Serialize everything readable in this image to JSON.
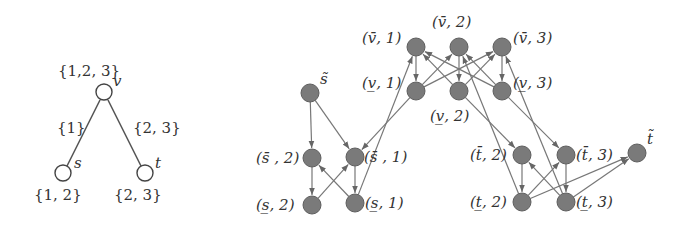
{
  "tree": {
    "nodes": [
      {
        "id": "v",
        "name": "v",
        "x": 104,
        "y": 92,
        "set": "{1,2, 3}"
      },
      {
        "id": "s",
        "name": "s",
        "x": 63,
        "y": 173,
        "set": "{1, 2}"
      },
      {
        "id": "t",
        "name": "t",
        "x": 145,
        "y": 173,
        "set": "{2, 3}"
      }
    ],
    "edges": [
      {
        "from": "v",
        "to": "s",
        "label": "{1}"
      },
      {
        "from": "v",
        "to": "t",
        "label": "{2, 3}"
      }
    ]
  },
  "graph": {
    "node_color": "#7a7a7a",
    "edge_color": "#777777",
    "nodes": [
      {
        "id": "s_tilde",
        "label": "s̃",
        "x": 310,
        "y": 93
      },
      {
        "id": "s_bar_2",
        "label": "(s̄, 2)",
        "x": 312,
        "y": 158
      },
      {
        "id": "s_bar_1",
        "label": "(s̄, 1)",
        "x": 355,
        "y": 157
      },
      {
        "id": "s_under_2",
        "label": "(s̲, 2)",
        "x": 312,
        "y": 205
      },
      {
        "id": "s_under_1",
        "label": "(s̲, 1)",
        "x": 355,
        "y": 203
      },
      {
        "id": "v_bar_1",
        "label": "(v̄, 1)",
        "x": 416,
        "y": 47
      },
      {
        "id": "v_bar_2",
        "label": "(v̄, 2)",
        "x": 459,
        "y": 47
      },
      {
        "id": "v_bar_3",
        "label": "(v̄, 3)",
        "x": 502,
        "y": 47
      },
      {
        "id": "v_under_1",
        "label": "(v̲, 1)",
        "x": 416,
        "y": 91
      },
      {
        "id": "v_under_2",
        "label": "(v̲, 2)",
        "x": 459,
        "y": 91
      },
      {
        "id": "v_under_3",
        "label": "(v̲, 3)",
        "x": 502,
        "y": 91
      },
      {
        "id": "t_bar_2",
        "label": "(t̄, 2)",
        "x": 522,
        "y": 155
      },
      {
        "id": "t_bar_3",
        "label": "(t̄, 3)",
        "x": 566,
        "y": 155
      },
      {
        "id": "t_under_2",
        "label": "(t̲, 2)",
        "x": 522,
        "y": 202
      },
      {
        "id": "t_under_3",
        "label": "(t̲, 3)",
        "x": 566,
        "y": 202
      },
      {
        "id": "t_tilde",
        "label": "t̃",
        "x": 637,
        "y": 153
      }
    ],
    "edges": [
      [
        "s_tilde",
        "s_bar_2"
      ],
      [
        "s_tilde",
        "s_bar_1"
      ],
      [
        "s_bar_2",
        "s_under_2"
      ],
      [
        "s_bar_1",
        "s_under_1"
      ],
      [
        "s_under_2",
        "s_bar_1"
      ],
      [
        "s_under_1",
        "s_bar_2"
      ],
      [
        "s_under_1",
        "v_bar_1"
      ],
      [
        "v_under_1",
        "s_bar_1"
      ],
      [
        "v_bar_1",
        "v_under_1"
      ],
      [
        "v_bar_2",
        "v_under_2"
      ],
      [
        "v_bar_3",
        "v_under_3"
      ],
      [
        "v_under_1",
        "v_bar_2"
      ],
      [
        "v_under_1",
        "v_bar_3"
      ],
      [
        "v_under_2",
        "v_bar_1"
      ],
      [
        "v_under_2",
        "v_bar_3"
      ],
      [
        "v_under_3",
        "v_bar_1"
      ],
      [
        "v_under_3",
        "v_bar_2"
      ],
      [
        "v_under_2",
        "t_bar_2"
      ],
      [
        "v_under_3",
        "t_bar_3"
      ],
      [
        "t_under_2",
        "v_bar_2"
      ],
      [
        "t_under_3",
        "v_bar_3"
      ],
      [
        "t_bar_2",
        "t_under_2"
      ],
      [
        "t_bar_3",
        "t_under_3"
      ],
      [
        "t_under_2",
        "t_bar_3"
      ],
      [
        "t_under_3",
        "t_bar_2"
      ],
      [
        "t_under_2",
        "t_tilde"
      ],
      [
        "t_under_3",
        "t_tilde"
      ]
    ]
  },
  "labels": {
    "v_set": "{1,2, 3}",
    "v_name": "v",
    "edge_vs": "{1}",
    "edge_vt": "{2, 3}",
    "s_name": "s",
    "s_set": "{1, 2}",
    "t_name": "t",
    "t_set": "{2, 3}",
    "s_tilde": "s̃",
    "s_bar_2": "(s̄ , 2)",
    "s_bar_1": "(s̄ , 1)",
    "s_under_2": "(s̲, 2)",
    "s_under_1": "(s̲, 1)",
    "v_bar_1": "(v̄, 1)",
    "v_bar_2": "(v̄, 2)",
    "v_bar_3": "(v̄, 3)",
    "v_under_1": "(v̲, 1)",
    "v_under_2": "(v̲, 2)",
    "v_under_3": "(v̲, 3)",
    "t_bar_2": "(t̄, 2)",
    "t_bar_3": "(t̄, 3)",
    "t_under_2": "(t̲, 2)",
    "t_under_3": "(t̲, 3)",
    "t_tilde": "t̃"
  }
}
